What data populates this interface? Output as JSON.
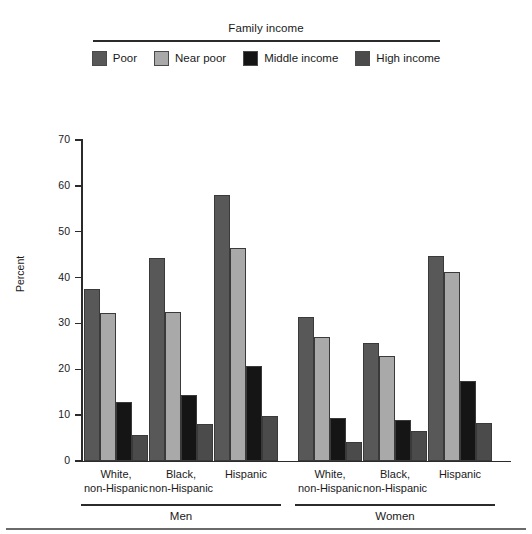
{
  "legend": {
    "title": "Family income",
    "items": [
      {
        "label": "Poor",
        "color": "#585858"
      },
      {
        "label": "Near poor",
        "color": "#a9a9a9"
      },
      {
        "label": "Middle income",
        "color": "#151515"
      },
      {
        "label": "High income",
        "color": "#4b4b4b"
      }
    ]
  },
  "axis": {
    "ylabel": "Percent",
    "yticks": [
      "0",
      "10",
      "20",
      "30",
      "40",
      "50",
      "60",
      "70"
    ]
  },
  "groups": [
    {
      "label": "White,\nnon-Hispanic"
    },
    {
      "label": "Black,\nnon-Hispanic"
    },
    {
      "label": "Hispanic"
    },
    {
      "label": "White,\nnon-Hispanic"
    },
    {
      "label": "Black,\nnon-Hispanic"
    },
    {
      "label": "Hispanic"
    }
  ],
  "sex_brackets": [
    {
      "label": "Men"
    },
    {
      "label": "Women"
    }
  ],
  "chart_data": {
    "type": "bar",
    "title": "Family income",
    "xlabel": "",
    "ylabel": "Percent",
    "ylim": [
      0,
      70
    ],
    "ytick_step": 10,
    "grid": false,
    "legend_position": "top-center",
    "categories": [
      "Men - White, non-Hispanic",
      "Men - Black, non-Hispanic",
      "Men - Hispanic",
      "Women - White, non-Hispanic",
      "Women - Black, non-Hispanic",
      "Women - Hispanic"
    ],
    "series": [
      {
        "name": "Poor",
        "color": "#585858",
        "values": [
          37.5,
          44.2,
          58.0,
          31.5,
          25.8,
          44.6
        ]
      },
      {
        "name": "Near poor",
        "color": "#a9a9a9",
        "values": [
          32.2,
          32.5,
          46.4,
          27.1,
          23.0,
          41.2
        ]
      },
      {
        "name": "Middle income",
        "color": "#151515",
        "values": [
          12.8,
          14.4,
          20.7,
          9.4,
          8.9,
          17.5
        ]
      },
      {
        "name": "High income",
        "color": "#4b4b4b",
        "values": [
          5.7,
          8.1,
          9.8,
          4.1,
          6.6,
          8.2
        ]
      }
    ]
  }
}
